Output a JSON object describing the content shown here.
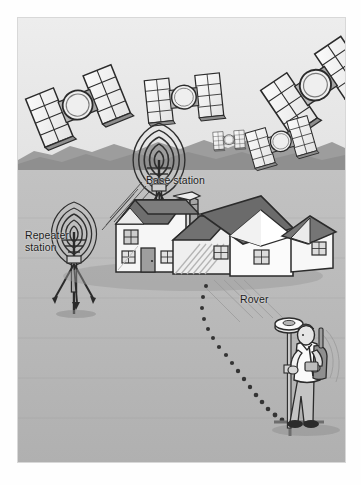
{
  "figure": {
    "type": "illustration",
    "palette": {
      "page_background": "#fefefe",
      "sky": "#e9e9e9",
      "hills": "#9a9a9a",
      "ground": "#b6b6b6",
      "roof_dark": "#6f6f6f",
      "roof_mid": "#8c8c8c",
      "wall_light": "#f4f4f4",
      "wall_shade": "#cfcfcf",
      "outline": "#2b2b2b",
      "satellite_panel": "#f6f6f6",
      "satellite_body": "#9e9e9e",
      "label_text": "#1d1d1d",
      "dotted_path": "#3a3a3a"
    }
  },
  "labels": {
    "base_station": "Base station",
    "repeater_station_line1": "Repeater",
    "repeater_station_line2": "station",
    "rover": "Rover"
  },
  "scene_objects": {
    "satellites": [
      {
        "name": "satellite-upper-left",
        "cx": 60,
        "cy": 88,
        "scale": 1.0,
        "rotate": -22
      },
      {
        "name": "satellite-upper-mid",
        "cx": 166,
        "cy": 80,
        "scale": 0.82,
        "rotate": -6
      },
      {
        "name": "satellite-upper-right",
        "cx": 298,
        "cy": 68,
        "scale": 1.05,
        "rotate": -34
      },
      {
        "name": "satellite-small-far",
        "cx": 211,
        "cy": 122,
        "scale": 0.34,
        "rotate": -4
      },
      {
        "name": "satellite-mid-right",
        "cx": 263,
        "cy": 124,
        "scale": 0.7,
        "rotate": -16
      }
    ],
    "stations": [
      {
        "name": "base-station-tripod",
        "x": 141,
        "y": 172,
        "waves": 5
      },
      {
        "name": "repeater-station-tripod",
        "x": 74,
        "y": 232,
        "waves": 5
      }
    ],
    "buildings": [
      {
        "name": "farmhouse-left-wing"
      },
      {
        "name": "farmhouse-centre-wing"
      },
      {
        "name": "farmhouse-main-gable"
      },
      {
        "name": "farmhouse-right-wing"
      },
      {
        "name": "chimney-stack"
      }
    ],
    "rover_unit": {
      "name": "rover-surveyor",
      "pole_top_antenna": true,
      "backpack": true,
      "x": 288,
      "y": 318
    },
    "survey_path": {
      "name": "dotted-survey-path",
      "style": "dotted",
      "dot_count": 17
    }
  }
}
